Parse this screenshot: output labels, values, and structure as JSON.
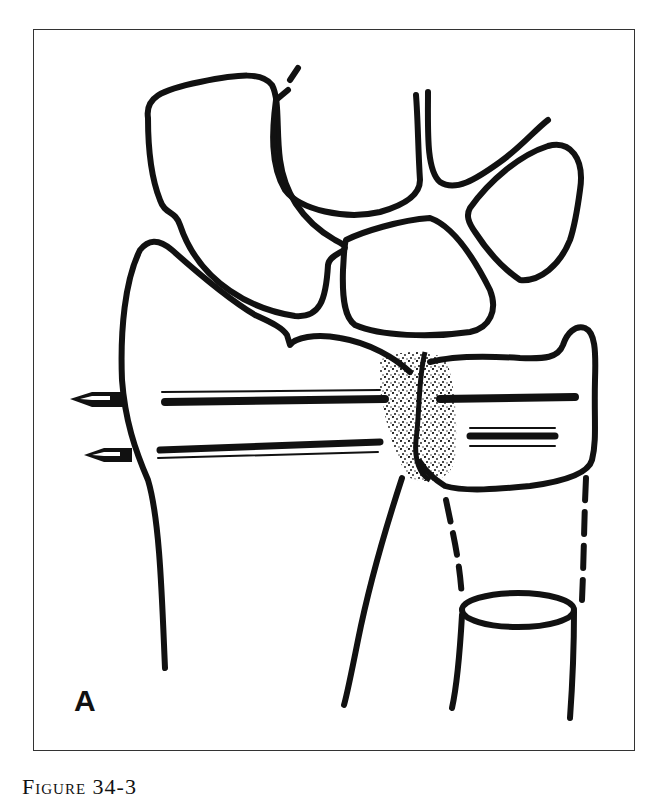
{
  "figure": {
    "panel_label": "A",
    "caption_label": "Figure",
    "caption_number": "34-3",
    "colors": {
      "ink": "#111111",
      "frame": "#333333",
      "background": "#ffffff"
    }
  },
  "elements": {
    "carpal_bones": [
      "scaphoid",
      "lunate",
      "triquetrum",
      "capitate",
      "hamate"
    ],
    "pins": [
      {
        "name": "upper-pin",
        "tip_x": 70,
        "y": 399
      },
      {
        "name": "lower-pin",
        "tip_x": 84,
        "y": 455
      }
    ],
    "fracture_zone": "stippled",
    "ulna_cross_section": "oval with marrow detail"
  }
}
